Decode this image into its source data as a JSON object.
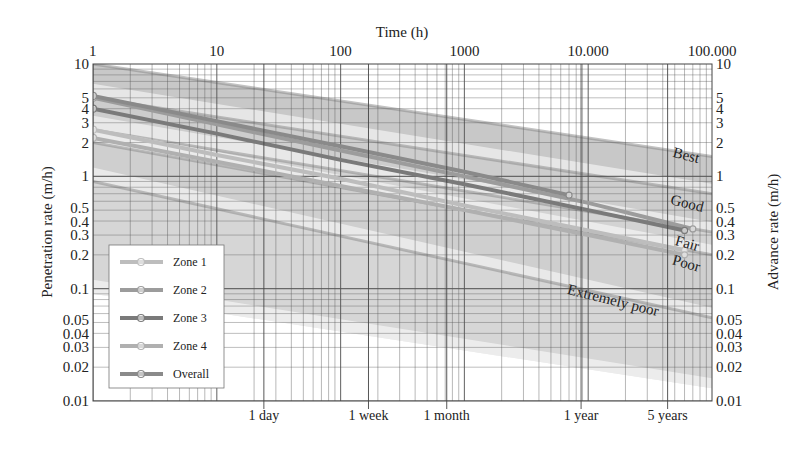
{
  "chart_data": {
    "type": "line",
    "title": "",
    "top_axis_title": "Time (h)",
    "ylabel": "Penetration rate (m/h)",
    "ylabel_right": "Advance rate (m/h)",
    "x_scale": "log",
    "y_scale": "log",
    "xlim": [
      1,
      100000
    ],
    "ylim": [
      0.01,
      10
    ],
    "top_ticks": [
      {
        "value": 1,
        "label": "1"
      },
      {
        "value": 10,
        "label": "10"
      },
      {
        "value": 100,
        "label": "100"
      },
      {
        "value": 1000,
        "label": "1000"
      },
      {
        "value": 10000,
        "label": "10.000"
      },
      {
        "value": 100000,
        "label": "100.000"
      }
    ],
    "bottom_ticks": [
      {
        "value": 24,
        "label": "1 day"
      },
      {
        "value": 168,
        "label": "1 week"
      },
      {
        "value": 720,
        "label": "1 month"
      },
      {
        "value": 8760,
        "label": "1 year"
      },
      {
        "value": 43800,
        "label": "5 years"
      }
    ],
    "y_ticks": [
      {
        "value": 10,
        "label": "10"
      },
      {
        "value": 5,
        "label": "5"
      },
      {
        "value": 4,
        "label": "4"
      },
      {
        "value": 3,
        "label": "3"
      },
      {
        "value": 2,
        "label": "2"
      },
      {
        "value": 1,
        "label": "1"
      },
      {
        "value": 0.5,
        "label": "0.5"
      },
      {
        "value": 0.4,
        "label": "0.4"
      },
      {
        "value": 0.3,
        "label": "0.3"
      },
      {
        "value": 0.2,
        "label": "0.2"
      },
      {
        "value": 0.1,
        "label": "0.1"
      },
      {
        "value": 0.05,
        "label": "0.05"
      },
      {
        "value": 0.04,
        "label": "0.04"
      },
      {
        "value": 0.03,
        "label": "0.03"
      },
      {
        "value": 0.02,
        "label": "0.02"
      },
      {
        "value": 0.01,
        "label": "0.01"
      }
    ],
    "bands": [
      {
        "name": "Best",
        "label": "Best",
        "upper": [
          [
            1,
            10
          ],
          [
            100000,
            1.5
          ]
        ],
        "lower": [
          [
            1,
            5
          ],
          [
            100000,
            0.7
          ]
        ],
        "color": "#9a9a9a"
      },
      {
        "name": "Good",
        "label": "Good",
        "upper": [
          [
            1,
            5
          ],
          [
            100000,
            0.7
          ]
        ],
        "lower": [
          [
            1,
            2.6
          ],
          [
            100000,
            0.32
          ]
        ],
        "color": "#a4a4a4"
      },
      {
        "name": "Fair",
        "label": "Fair",
        "upper": [
          [
            1,
            2.6
          ],
          [
            100000,
            0.32
          ]
        ],
        "lower": [
          [
            1,
            2.0
          ],
          [
            100000,
            0.2
          ]
        ],
        "color": "#aeaeae"
      },
      {
        "name": "Poor",
        "label": "Poor",
        "upper": [
          [
            1,
            2.0
          ],
          [
            100000,
            0.2
          ]
        ],
        "lower": [
          [
            1,
            0.9
          ],
          [
            100000,
            0.055
          ]
        ],
        "color": "#a8a8a8"
      },
      {
        "name": "Extremely poor",
        "label": "Extremely poor",
        "upper": [
          [
            1,
            0.9
          ],
          [
            100000,
            0.055
          ]
        ],
        "lower": [
          [
            1,
            0.09
          ],
          [
            100000,
            0.013
          ]
        ],
        "color": "#b4b4b4"
      }
    ],
    "series": [
      {
        "name": "Zone 1",
        "color": "#bdbdbd",
        "points": [
          [
            1,
            2.6
          ],
          [
            10,
            1.55
          ],
          [
            100,
            0.95
          ],
          [
            1000,
            0.55
          ],
          [
            10000,
            0.33
          ],
          [
            60000,
            0.22
          ]
        ]
      },
      {
        "name": "Zone 2",
        "color": "#9c9c9c",
        "points": [
          [
            1,
            5.0
          ],
          [
            10,
            2.9
          ],
          [
            100,
            1.7
          ],
          [
            1000,
            1.0
          ],
          [
            10000,
            0.58
          ],
          [
            70000,
            0.34
          ]
        ]
      },
      {
        "name": "Zone 3",
        "color": "#7a7a7a",
        "points": [
          [
            1,
            4.0
          ],
          [
            10,
            2.4
          ],
          [
            100,
            1.4
          ],
          [
            1000,
            0.85
          ],
          [
            10000,
            0.5
          ],
          [
            60000,
            0.33
          ]
        ]
      },
      {
        "name": "Zone 4",
        "color": "#b0b0b0",
        "points": [
          [
            1,
            2.2
          ],
          [
            10,
            1.35
          ],
          [
            100,
            0.82
          ],
          [
            1000,
            0.5
          ],
          [
            10000,
            0.3
          ],
          [
            60000,
            0.2
          ]
        ]
      },
      {
        "name": "Overall",
        "color": "#8a8a8a",
        "points": [
          [
            1,
            5.2
          ],
          [
            10,
            3.1
          ],
          [
            100,
            1.85
          ],
          [
            1000,
            1.1
          ],
          [
            7000,
            0.68
          ]
        ]
      }
    ],
    "legend": {
      "position": "lower-left",
      "entries": [
        "Zone 1",
        "Zone 2",
        "Zone 3",
        "Zone 4",
        "Overall"
      ]
    },
    "grid": true
  }
}
